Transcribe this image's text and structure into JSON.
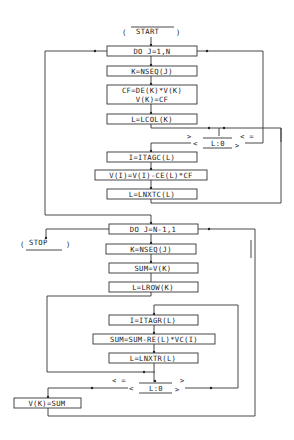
{
  "diagram": {
    "type": "flowchart",
    "start": {
      "label": "START"
    },
    "stop": {
      "label": "STOP"
    },
    "loop1": {
      "do": "DO J=1,N",
      "steps": [
        "K=NSEQ(J)",
        "CF=DE(K)*V(K)",
        "V(K)=CF",
        "L=LCOL(K)"
      ],
      "decision": {
        "label": "L:0",
        "gt": ">",
        "le": "< ="
      },
      "inner": [
        "I=ITAGC(L)",
        "V(I)=V(I)-CE(L)*CF",
        "L=LNXTC(L)"
      ]
    },
    "loop2": {
      "do": "DO J=N-1,1",
      "steps": [
        "K=NSEQ(J)",
        "SUM=V(K)",
        "L=LROW(K)"
      ],
      "inner": [
        "I=ITAGR(L)",
        "SUM=SUM-RE(L)*VC(I)",
        "L=LNXTR(L)"
      ],
      "decision": {
        "label": "L:0",
        "le": "< =",
        "gt": ">"
      },
      "final": "V(K)=SUM"
    }
  }
}
